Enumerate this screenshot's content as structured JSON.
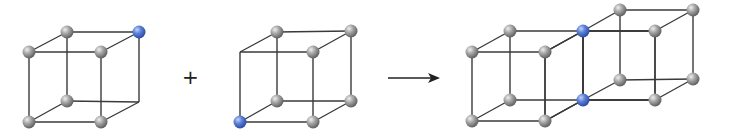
{
  "diagram": {
    "colors": {
      "edge": "#3a3a3a",
      "atom_gray": "#8a8a8a",
      "atom_gray_light": "#e0e0e0",
      "atom_blue": "#3f63c6",
      "atom_blue_light": "#a9c0f2",
      "background": "#ffffff"
    },
    "operators": {
      "plus": "+",
      "arrow": "arrow-right"
    },
    "cubes": [
      {
        "name": "cube-1",
        "vertices": [
          {
            "id": "ftl",
            "x": 29,
            "y": 52,
            "atom": "gray"
          },
          {
            "id": "ftr",
            "x": 101,
            "y": 52,
            "atom": "gray"
          },
          {
            "id": "fbl",
            "x": 29,
            "y": 122,
            "atom": "gray"
          },
          {
            "id": "fbr",
            "x": 101,
            "y": 122,
            "atom": "gray"
          },
          {
            "id": "btl",
            "x": 67,
            "y": 32,
            "atom": "gray"
          },
          {
            "id": "btr",
            "x": 139,
            "y": 32,
            "atom": "blue"
          },
          {
            "id": "bbl",
            "x": 67,
            "y": 101,
            "atom": "gray"
          },
          {
            "id": "bbr",
            "x": 139,
            "y": 102,
            "atom": "none"
          }
        ]
      },
      {
        "name": "cube-2",
        "vertices": [
          {
            "id": "ftl",
            "x": 240,
            "y": 52,
            "atom": "none"
          },
          {
            "id": "ftr",
            "x": 313,
            "y": 52,
            "atom": "gray"
          },
          {
            "id": "fbl",
            "x": 240,
            "y": 122,
            "atom": "blue"
          },
          {
            "id": "fbr",
            "x": 313,
            "y": 122,
            "atom": "gray"
          },
          {
            "id": "btl",
            "x": 277,
            "y": 32,
            "atom": "gray"
          },
          {
            "id": "btr",
            "x": 351,
            "y": 31,
            "atom": "gray"
          },
          {
            "id": "bbl",
            "x": 277,
            "y": 101,
            "atom": "gray"
          },
          {
            "id": "bbr",
            "x": 351,
            "y": 101,
            "atom": "gray"
          }
        ]
      },
      {
        "name": "result-cube-left",
        "vertices": [
          {
            "id": "ftl",
            "x": 472,
            "y": 52,
            "atom": "gray"
          },
          {
            "id": "ftr",
            "x": 545,
            "y": 52,
            "atom": "gray"
          },
          {
            "id": "fbl",
            "x": 472,
            "y": 121,
            "atom": "gray"
          },
          {
            "id": "fbr",
            "x": 545,
            "y": 121,
            "atom": "gray"
          },
          {
            "id": "btl",
            "x": 510,
            "y": 31,
            "atom": "gray"
          },
          {
            "id": "btr",
            "x": 583,
            "y": 31,
            "atom": "blue"
          },
          {
            "id": "bbl",
            "x": 510,
            "y": 100,
            "atom": "gray"
          },
          {
            "id": "bbr",
            "x": 583,
            "y": 100,
            "atom": "blue"
          }
        ]
      },
      {
        "name": "result-cube-right",
        "vertices": [
          {
            "id": "ftl",
            "x": 545,
            "y": 52,
            "atom": "skip"
          },
          {
            "id": "ftr",
            "x": 583,
            "y": 31,
            "atom": "skip"
          },
          {
            "id": "fbl",
            "x": 545,
            "y": 121,
            "atom": "skip"
          },
          {
            "id": "fbr",
            "x": 583,
            "y": 100,
            "atom": "skip"
          },
          {
            "id": "btl",
            "x": 583,
            "y": 31,
            "atom": "skip"
          },
          {
            "id": "btr",
            "x": 655,
            "y": 31,
            "atom": "gray"
          },
          {
            "id": "bbl",
            "x": 583,
            "y": 100,
            "atom": "skip"
          },
          {
            "id": "bbr",
            "x": 655,
            "y": 100,
            "atom": "gray"
          }
        ]
      },
      {
        "name": "result-cube-back",
        "vertices": [
          {
            "id": "ftl",
            "x": 583,
            "y": 31,
            "atom": "skip"
          },
          {
            "id": "ftr",
            "x": 655,
            "y": 31,
            "atom": "skip"
          },
          {
            "id": "fbl",
            "x": 583,
            "y": 100,
            "atom": "skip"
          },
          {
            "id": "fbr",
            "x": 655,
            "y": 100,
            "atom": "skip"
          },
          {
            "id": "btl",
            "x": 620,
            "y": 10,
            "atom": "gray"
          },
          {
            "id": "btr",
            "x": 693,
            "y": 10,
            "atom": "gray"
          },
          {
            "id": "bbl",
            "x": 620,
            "y": 80,
            "atom": "gray"
          },
          {
            "id": "bbr",
            "x": 693,
            "y": 79,
            "atom": "gray"
          }
        ]
      }
    ],
    "plus_pos": {
      "x": 189,
      "y": 79
    },
    "arrow_pos": {
      "x1": 388,
      "y1": 78,
      "x2": 438,
      "y2": 78
    }
  }
}
